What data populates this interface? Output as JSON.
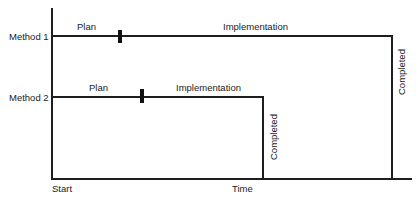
{
  "diagram": {
    "axes": {
      "x_start_label": "Start",
      "x_label": "Time"
    },
    "methods": [
      {
        "label": "Method 1",
        "phase_1": "Plan",
        "phase_2": "Implementation",
        "end_label": "Completed"
      },
      {
        "label": "Method 2",
        "phase_1": "Plan",
        "phase_2": "Implementation",
        "end_label": "Completed"
      }
    ],
    "colors": {
      "line": "#1e1e1e",
      "background": "#ffffff"
    }
  }
}
